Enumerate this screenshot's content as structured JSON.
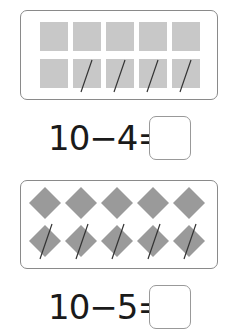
{
  "problems": [
    {
      "shape": "square",
      "count": 10,
      "crossed_out": 4,
      "equation": "10−4=",
      "answer": ""
    },
    {
      "shape": "diamond",
      "count": 10,
      "crossed_out": 5,
      "equation": "10−5=",
      "answer": ""
    }
  ],
  "colors": {
    "shape_fill_square": "#c8c8c8",
    "shape_fill_diamond": "#9a9a9a",
    "border": "#8a8a8a",
    "strike": "#333333"
  }
}
